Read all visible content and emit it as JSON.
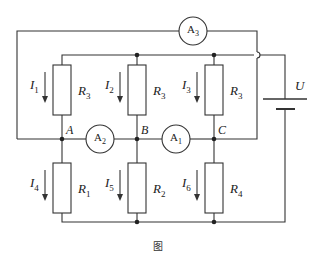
{
  "figure": {
    "caption": "图",
    "colors": {
      "line": "#333333",
      "background": "#ffffff"
    }
  },
  "nodes": {
    "A": "A",
    "B": "B",
    "C": "C"
  },
  "ammeters": {
    "a1": {
      "letter": "A",
      "sub": "1"
    },
    "a2": {
      "letter": "A",
      "sub": "2"
    },
    "a3": {
      "letter": "A",
      "sub": "3"
    }
  },
  "source": {
    "label": "U"
  },
  "resistors": {
    "upper_left": {
      "letter": "R",
      "sub": "3"
    },
    "upper_mid": {
      "letter": "R",
      "sub": "3"
    },
    "upper_right": {
      "letter": "R",
      "sub": "3"
    },
    "lower_left": {
      "letter": "R",
      "sub": "1"
    },
    "lower_mid": {
      "letter": "R",
      "sub": "2"
    },
    "lower_right": {
      "letter": "R",
      "sub": "4"
    }
  },
  "currents": {
    "i1": {
      "letter": "I",
      "sub": "1"
    },
    "i2": {
      "letter": "I",
      "sub": "2"
    },
    "i3": {
      "letter": "I",
      "sub": "3"
    },
    "i4": {
      "letter": "I",
      "sub": "4"
    },
    "i5": {
      "letter": "I",
      "sub": "5"
    },
    "i6": {
      "letter": "I",
      "sub": "6"
    }
  }
}
